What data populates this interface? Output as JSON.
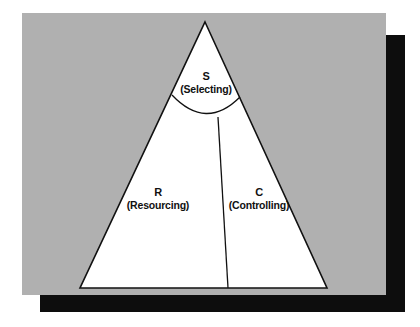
{
  "figure": {
    "panel_color": "#b0b0b0",
    "shadow_color": "#0d0d0d",
    "triangle_fill": "#ffffff",
    "stroke_color": "#111111",
    "regions": [
      {
        "id": "selecting",
        "code": "S",
        "name": "(Selecting)",
        "position": "apex"
      },
      {
        "id": "resourcing",
        "code": "R",
        "name": "(Resourcing)",
        "position": "lower-left"
      },
      {
        "id": "controlling",
        "code": "C",
        "name": "(Controlling)",
        "position": "lower-right"
      }
    ],
    "geometry": {
      "apex": [
        205,
        22
      ],
      "base_left": [
        80,
        288
      ],
      "base_right": [
        327,
        288
      ],
      "arc_left": [
        172,
        95
      ],
      "arc_right": [
        240,
        97
      ],
      "arc_bottom": [
        206,
        118
      ],
      "divider_top": [
        218,
        117
      ],
      "divider_bottom": [
        228,
        288
      ]
    }
  }
}
